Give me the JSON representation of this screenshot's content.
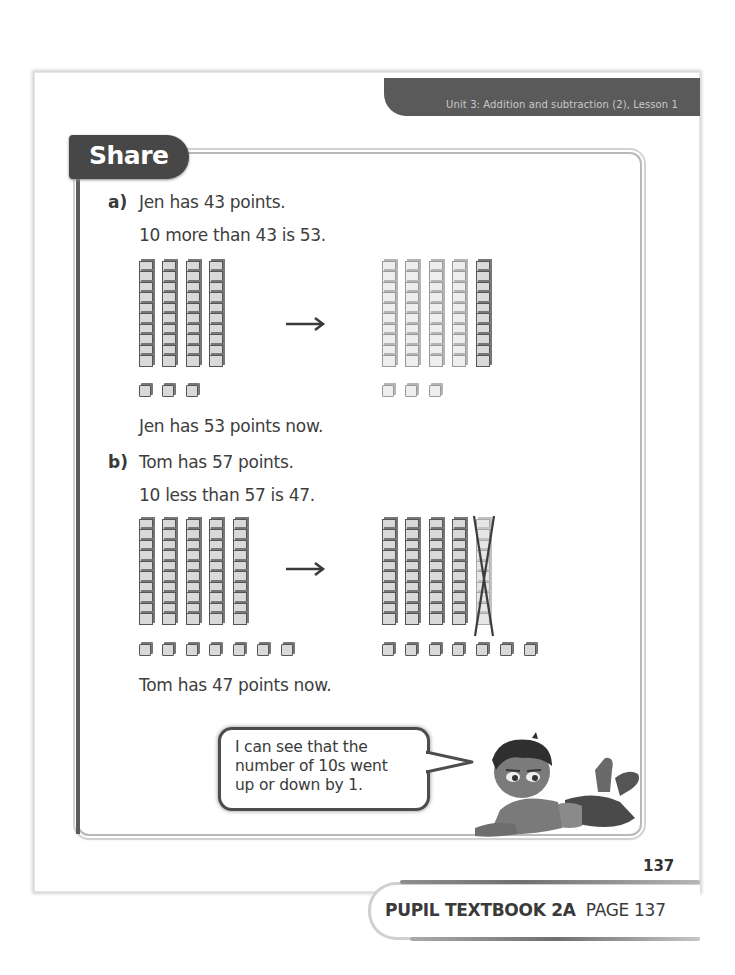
{
  "header": {
    "unit_label": "Unit 3: Addition and subtraction (2), Lesson 1"
  },
  "section": {
    "title": "Share"
  },
  "part_a": {
    "label": "a)",
    "line1": "Jen has 43 points.",
    "line2": "10 more than 43 is 53.",
    "result": "Jen has 53 points now.",
    "before": {
      "tens": 4,
      "ones": 3
    },
    "after": {
      "tens": 5,
      "ones": 3,
      "added_tens": 1
    }
  },
  "part_b": {
    "label": "b)",
    "line1": "Tom has 57 points.",
    "line2": "10 less than 57 is 47.",
    "result": "Tom has 47 points now.",
    "before": {
      "tens": 5,
      "ones": 7
    },
    "after": {
      "tens": 5,
      "ones": 7,
      "crossed_tens": 1
    }
  },
  "speech_bubble": {
    "line1": "I can see that the",
    "line2": "number of 10s went",
    "line3": "up or down by 1."
  },
  "page_number": "137",
  "footer": {
    "book": "PUPIL TEXTBOOK 2A",
    "page": "PAGE 137"
  },
  "icons": {
    "arrow": "right-arrow-icon",
    "character": "child-character-illustration"
  }
}
